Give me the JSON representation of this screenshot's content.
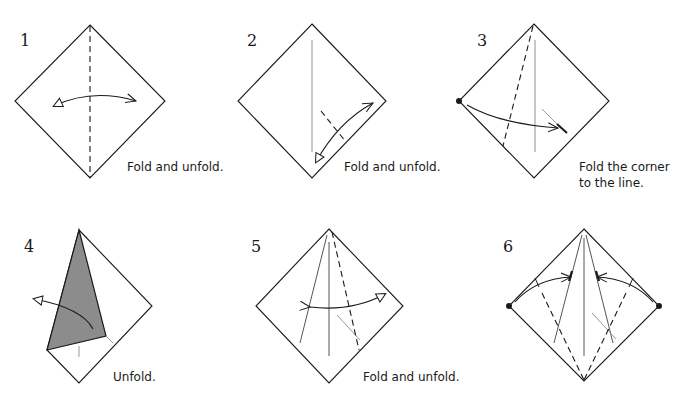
{
  "colors": {
    "line": "#1a1a1a",
    "crease": "#9a9a9a",
    "shaded_flap": "#8c8c8c"
  },
  "steps": [
    {
      "number": "1",
      "caption": "Fold and unfold.",
      "arrow": "valley-fold-and-unfold-arrow"
    },
    {
      "number": "2",
      "caption": "Fold and unfold.",
      "arrow": "valley-fold-and-unfold-arrow"
    },
    {
      "number": "3",
      "caption": "Fold the corner\nto the line.",
      "arrow": "valley-fold-arrow"
    },
    {
      "number": "4",
      "caption": "Unfold.",
      "arrow": "unfold-arrow"
    },
    {
      "number": "5",
      "caption": "Fold and unfold.",
      "arrow": "valley-fold-and-unfold-arrow"
    },
    {
      "number": "6",
      "caption": "",
      "arrow": "double-valley-fold-arrows"
    }
  ]
}
